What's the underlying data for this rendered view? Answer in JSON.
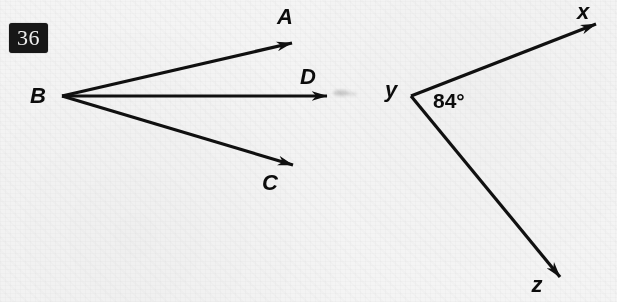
{
  "page": {
    "width": 617,
    "height": 302,
    "background_color": "#f4f4f4",
    "ink_color": "#101010"
  },
  "exercise": {
    "number": "36",
    "badge_background": "#171717",
    "badge_text_color": "#f2f2f2"
  },
  "figures": [
    {
      "id": "left-figure",
      "name": "three-rays-from-vertex-B",
      "vertex": {
        "label": "B",
        "x": 62,
        "y": 96
      },
      "vertex_label_pos": {
        "x": 38,
        "y": 100
      },
      "rays": [
        {
          "name": "ray-BA",
          "label": "A",
          "from": {
            "x": 62,
            "y": 96
          },
          "to": {
            "x": 296,
            "y": 42
          },
          "label_pos": {
            "x": 285,
            "y": 24
          }
        },
        {
          "name": "ray-BD",
          "label": "D",
          "from": {
            "x": 62,
            "y": 96
          },
          "to": {
            "x": 331,
            "y": 96
          },
          "label_pos": {
            "x": 308,
            "y": 83
          }
        },
        {
          "name": "ray-BC",
          "label": "C",
          "from": {
            "x": 62,
            "y": 96
          },
          "to": {
            "x": 297,
            "y": 166
          },
          "label_pos": {
            "x": 270,
            "y": 190
          }
        }
      ]
    },
    {
      "id": "right-figure",
      "name": "angle-xyz",
      "vertex": {
        "label": "y",
        "x": 411,
        "y": 96
      },
      "vertex_label_pos": {
        "x": 388,
        "y": 96
      },
      "angle_measure": "84°",
      "angle_label_pos": {
        "x": 433,
        "y": 107
      },
      "rays": [
        {
          "name": "ray-yx",
          "label": "x",
          "from": {
            "x": 411,
            "y": 96
          },
          "to": {
            "x": 601,
            "y": 22
          },
          "label_pos": {
            "x": 577,
            "y": 17
          }
        },
        {
          "name": "ray-yz",
          "label": "z",
          "from": {
            "x": 411,
            "y": 96
          },
          "to": {
            "x": 566,
            "y": 284
          },
          "label_pos": {
            "x": 531,
            "y": 292
          }
        }
      ]
    }
  ]
}
